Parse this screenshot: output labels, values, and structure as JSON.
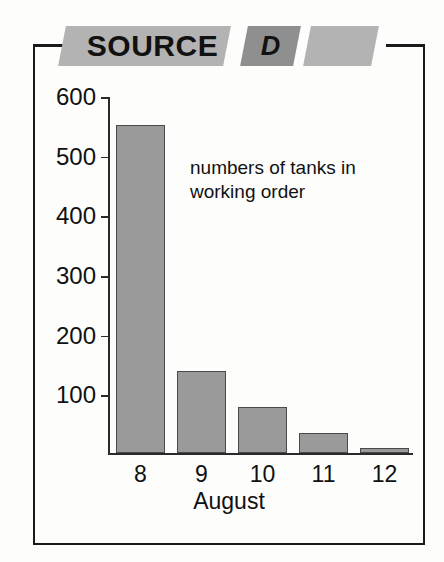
{
  "banner": {
    "title": "SOURCE",
    "letter": "D",
    "title_bg": "#b3b3b3",
    "letter_bg": "#8f8f8f",
    "tail_bg": "#b3b3b3"
  },
  "annotation": "numbers of tanks in working order",
  "colors": {
    "bar_fill": "#9a9a9a",
    "bar_stroke": "#4a4a4a",
    "axis": "#2a2a2a",
    "frame": "#1a1a1a",
    "page_bg": "#fdfdfb"
  },
  "chart_data": {
    "type": "bar",
    "title": "",
    "subtitle": "",
    "annotations": [
      "numbers of tanks in working order"
    ],
    "categories": [
      "8",
      "9",
      "10",
      "11",
      "12"
    ],
    "values": [
      550,
      138,
      77,
      34,
      8
    ],
    "series": [
      {
        "name": "numbers of tanks in working order",
        "values": [
          550,
          138,
          77,
          34,
          8
        ]
      }
    ],
    "xlabel": "August",
    "ylabel": "",
    "ylim": [
      0,
      600
    ],
    "yticks": [
      100,
      200,
      300,
      400,
      500,
      600
    ],
    "ytick_labels": [
      "100",
      "200",
      "300",
      "400",
      "500",
      "600"
    ],
    "xtick_labels": [
      "8",
      "9",
      "10",
      "11",
      "12"
    ],
    "grid": false,
    "legend": false
  }
}
